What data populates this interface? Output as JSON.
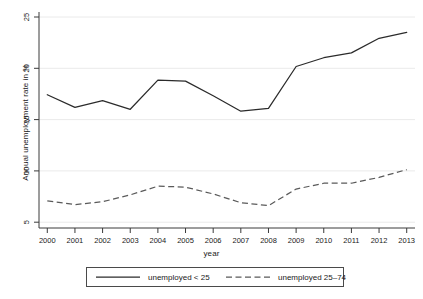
{
  "chart_data": {
    "type": "line",
    "title": "",
    "xlabel": "year",
    "ylabel": "Annual unemployment rate in %",
    "x": [
      2000,
      2001,
      2002,
      2003,
      2004,
      2005,
      2006,
      2007,
      2008,
      2009,
      2010,
      2011,
      2012,
      2013
    ],
    "xtick_labels": [
      "2000",
      "2001",
      "2002",
      "2003",
      "2004",
      "2005",
      "2006",
      "2007",
      "2008",
      "2009",
      "2010",
      "2011",
      "2012",
      "2013"
    ],
    "ytick_labels": [
      "5",
      "10",
      "15",
      "20",
      "25"
    ],
    "yticks": [
      5,
      10,
      15,
      20,
      25
    ],
    "ylim": [
      3.6,
      25.8
    ],
    "xlim": [
      1999.7,
      2013.3
    ],
    "grid": "horizontal",
    "legend_position": "bottom-outside",
    "series": [
      {
        "name": "unemployed < 25",
        "style": "solid",
        "color": "#2b2b2b",
        "values": [
          17.3,
          16.0,
          16.7,
          15.8,
          18.8,
          18.7,
          17.2,
          15.6,
          15.9,
          20.2,
          21.1,
          21.6,
          23.1,
          23.7
        ]
      },
      {
        "name": "unemployed 25–74",
        "style": "dashed",
        "color": "#5a5a5a",
        "values": [
          6.4,
          6.0,
          6.3,
          7.0,
          7.9,
          7.8,
          7.1,
          6.2,
          5.9,
          7.6,
          8.2,
          8.2,
          8.8,
          9.6
        ]
      }
    ]
  },
  "legend": {
    "items": [
      {
        "label": "unemployed < 25",
        "style": "solid"
      },
      {
        "label": "unemployed 25–74",
        "style": "dashed"
      }
    ]
  }
}
